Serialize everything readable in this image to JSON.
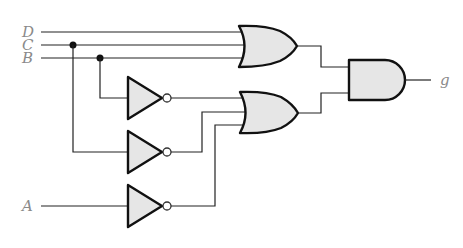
{
  "diagram": {
    "type": "logic-circuit",
    "inputs": [
      {
        "id": "D",
        "label": "D"
      },
      {
        "id": "C",
        "label": "C"
      },
      {
        "id": "B",
        "label": "B"
      },
      {
        "id": "A",
        "label": "A"
      }
    ],
    "output": {
      "id": "g",
      "label": "g"
    },
    "gates": [
      {
        "id": "or1",
        "type": "OR",
        "inputs": [
          "D",
          "C",
          "B"
        ]
      },
      {
        "id": "not1",
        "type": "NOT",
        "inputs": [
          "B"
        ]
      },
      {
        "id": "not2",
        "type": "NOT",
        "inputs": [
          "C"
        ]
      },
      {
        "id": "not3",
        "type": "NOT",
        "inputs": [
          "A"
        ]
      },
      {
        "id": "or2",
        "type": "OR",
        "inputs": [
          "not1",
          "not2",
          "not3"
        ]
      },
      {
        "id": "and1",
        "type": "AND",
        "inputs": [
          "or1",
          "or2"
        ]
      }
    ],
    "expression": "g = (D + C + B)(B' + C' + A')",
    "colors": {
      "gate_fill": "#e6e6e6",
      "stroke": "#111111",
      "label": "#8a8a8a"
    }
  }
}
